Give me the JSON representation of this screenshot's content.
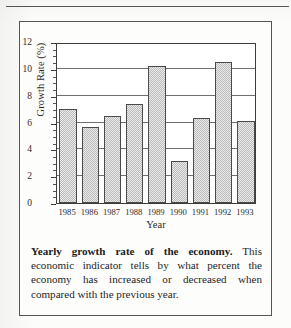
{
  "chart_data": {
    "type": "bar",
    "title": "",
    "xlabel": "Year",
    "ylabel": "Growth Rate (%)",
    "categories": [
      "1985",
      "1986",
      "1987",
      "1988",
      "1989",
      "1990",
      "1991",
      "1992",
      "1993"
    ],
    "values": [
      7.0,
      5.7,
      6.5,
      7.4,
      10.2,
      3.1,
      6.3,
      10.5,
      6.1
    ],
    "ylim": [
      0,
      12
    ],
    "ytick_labels": [
      "0",
      "2",
      "4",
      "6",
      "8",
      "10",
      "12"
    ],
    "ytick_values": [
      0,
      2,
      4,
      6,
      8,
      10,
      12
    ],
    "minor_tick_step": 0.5,
    "gridlines": [
      2,
      4,
      6,
      8,
      10
    ],
    "grid": true,
    "legend": "none",
    "bar_fill_color": "#dcdcdc",
    "bar_edge_color": "#4a4a4a",
    "axis_color": "#3c3c3c"
  },
  "caption": {
    "lead": "Yearly growth rate of the economy.",
    "body": " This economic indicator tells by what percent the economy has increased or decreased when compared with the previous year."
  }
}
